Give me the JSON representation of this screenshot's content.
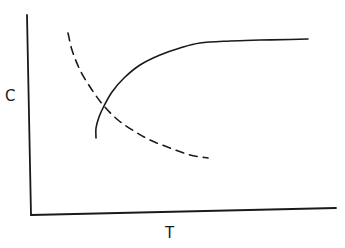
{
  "chart_data": {
    "type": "line",
    "title": "",
    "xlabel": "T",
    "ylabel": "C",
    "grid": false,
    "legend": null,
    "ticks": {
      "x": [],
      "y": []
    },
    "series": [
      {
        "name": "solid-curve",
        "style": "solid",
        "color": "#1a1a1a",
        "description": "rises steeply from a low starting point then saturates at a high plateau",
        "points_px": [
          [
            96,
            138
          ],
          [
            96,
            128
          ],
          [
            99,
            117
          ],
          [
            104,
            106
          ],
          [
            112,
            92
          ],
          [
            124,
            78
          ],
          [
            140,
            65
          ],
          [
            160,
            55
          ],
          [
            180,
            48
          ],
          [
            200,
            43
          ],
          [
            230,
            41
          ],
          [
            260,
            40
          ],
          [
            290,
            39.5
          ],
          [
            308,
            39
          ]
        ]
      },
      {
        "name": "dashed-curve",
        "style": "dashed",
        "color": "#1a1a1a",
        "description": "decreases from high value, decaying toward a lower asymptote",
        "points_px": [
          [
            68,
            33
          ],
          [
            72,
            50
          ],
          [
            80,
            70
          ],
          [
            92,
            90
          ],
          [
            104,
            106
          ],
          [
            118,
            120
          ],
          [
            134,
            131
          ],
          [
            150,
            140
          ],
          [
            170,
            148
          ],
          [
            190,
            155
          ],
          [
            208,
            158
          ]
        ]
      }
    ],
    "intersection_px": [
      104,
      106
    ],
    "axes_px": {
      "origin": [
        31,
        215
      ],
      "y_top": [
        27,
        15
      ],
      "x_end": [
        336,
        208
      ]
    }
  },
  "labels": {
    "x": "T",
    "y": "C"
  }
}
